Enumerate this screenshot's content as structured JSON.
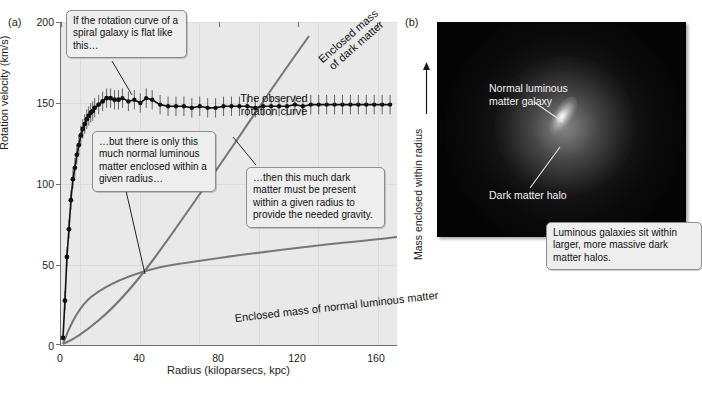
{
  "figure": {
    "panel_a_letter": "(a)",
    "panel_b_letter": "(b)"
  },
  "chart_data": {
    "type": "line",
    "xlabel": "Radius (kiloparsecs, kpc)",
    "ylabel": "Rotation velocity (km/s)",
    "ylabel_right": "Mass enclosed within radius",
    "xlim": [
      0,
      170
    ],
    "ylim": [
      0,
      200
    ],
    "xticks": [
      0,
      40,
      80,
      120,
      160
    ],
    "yticks": [
      0,
      50,
      100,
      150,
      200
    ],
    "grid": true,
    "legend": "none",
    "series": [
      {
        "name": "The observed rotation curve",
        "type": "scatter-with-errorbars",
        "color": "#111111",
        "x": [
          1,
          2,
          3,
          4,
          5,
          6,
          7,
          8,
          9,
          10,
          11,
          12,
          13,
          14,
          15,
          16,
          17,
          19,
          21,
          23,
          25,
          27,
          29,
          31,
          34,
          37,
          40,
          43,
          46,
          50,
          54,
          58,
          62,
          66,
          70,
          74,
          78,
          82,
          86,
          90,
          94,
          98,
          102,
          106,
          110,
          114,
          118,
          122,
          126,
          130,
          134,
          138,
          142,
          146,
          150,
          154,
          158,
          162,
          166
        ],
        "y": [
          5,
          28,
          55,
          72,
          90,
          103,
          110,
          118,
          124,
          130,
          134,
          137,
          140,
          142,
          144,
          145,
          147,
          149,
          151,
          153,
          153,
          152,
          152,
          153,
          151,
          152,
          150,
          153,
          152,
          149,
          148,
          148,
          148,
          147,
          148,
          147,
          147,
          148,
          148,
          148,
          148,
          147,
          148,
          148,
          148,
          148,
          149,
          148,
          149,
          149,
          149,
          149,
          149,
          149,
          149,
          149,
          149,
          149,
          149
        ],
        "yerr": 6
      },
      {
        "name": "Enclosed mass of dark matter",
        "type": "line",
        "color": "#777777",
        "description": "near-linear rise, steep slope, crossing the flat rotation curve near 100 kpc"
      },
      {
        "name": "Enclosed mass of normal luminous matter",
        "type": "line",
        "color": "#777777",
        "description": "rises quickly then flattens to a slow rise, far below the dark matter curve"
      }
    ],
    "annotations": [
      "If the rotation curve of a spiral galaxy is flat like this…",
      "The observed rotation curve",
      "Enclosed mass of dark matter",
      "…but there is only this much normal luminous matter enclosed within a given radius…",
      "…then this much dark matter must be present within a given radius to provide the needed gravity.",
      "Enclosed mass of normal luminous matter"
    ]
  },
  "panel_a": {
    "letter": "(a)",
    "axis": {
      "ylabel": "Rotation velocity (km/s)",
      "xlabel": "Radius (kiloparsecs, kpc)",
      "yticks": [
        "0",
        "50",
        "100",
        "150",
        "200"
      ],
      "xticks": [
        "0",
        "40",
        "80",
        "120",
        "160"
      ]
    },
    "callouts": {
      "flat": "If the rotation curve of a spiral galaxy is flat like this…",
      "luminous": "…but there is only this much normal luminous matter enclosed within a given radius…",
      "darkmatter": "…then this much dark matter must be present within a given radius to provide the needed gravity."
    },
    "labels": {
      "observed_curve": "The observed rotation curve",
      "dark_matter_mass": "Enclosed mass of dark matter",
      "dark_matter_mass_line1": "Enclosed mass",
      "dark_matter_mass_line2": "of dark matter",
      "luminous_mass": "Enclosed mass of normal luminous matter"
    }
  },
  "panel_b": {
    "letter": "(b)",
    "ylabel": "Mass enclosed within radius",
    "image_labels": {
      "normal_galaxy_line1": "Normal luminous",
      "normal_galaxy_line2": "matter galaxy",
      "dark_halo": "Dark matter halo"
    },
    "callout": "Luminous galaxies sit within larger, more massive dark matter halos."
  },
  "colors": {
    "plot_background": "#e9e9e9",
    "gridline": "#dcdcdc",
    "axis": "#6f6f6f",
    "data_curve": "#111111",
    "mass_curve": "#777777",
    "callout_bg": "#eeeeee",
    "callout_border": "#8d8d8d",
    "image_bg": "#050505",
    "image_label": "#f2f2f2"
  }
}
